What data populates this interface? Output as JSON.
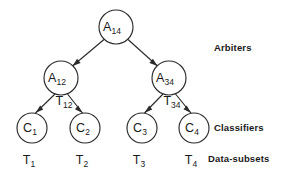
{
  "diagram": {
    "background_color": "#ffffff",
    "stroke_color": "#2b2b2b",
    "text_color": "#1a1a1a"
  },
  "nodes": {
    "root": {
      "base": "A",
      "sub": "14",
      "cx": 116,
      "cy": 27,
      "r": 17
    },
    "arbiter_left": {
      "base": "A",
      "sub": "12",
      "cx": 61,
      "cy": 78,
      "r": 17
    },
    "arbiter_right": {
      "base": "A",
      "sub": "34",
      "cx": 169,
      "cy": 78,
      "r": 17
    },
    "classifier_1": {
      "base": "C",
      "sub": "1",
      "cx": 32,
      "cy": 128,
      "r": 15
    },
    "classifier_2": {
      "base": "C",
      "sub": "2",
      "cx": 85,
      "cy": 128,
      "r": 15
    },
    "classifier_3": {
      "base": "C",
      "sub": "3",
      "cx": 142,
      "cy": 128,
      "r": 15
    },
    "classifier_4": {
      "base": "C",
      "sub": "4",
      "cx": 194,
      "cy": 128,
      "r": 15
    }
  },
  "edge_labels": {
    "left": {
      "base": "T",
      "sub": "12",
      "x": 68,
      "y": 104
    },
    "right": {
      "base": "T",
      "sub": "34",
      "x": 176,
      "y": 104
    }
  },
  "data_subsets": [
    {
      "base": "T",
      "sub": "1",
      "x": 32,
      "y": 163
    },
    {
      "base": "T",
      "sub": "2",
      "x": 85,
      "y": 163
    },
    {
      "base": "T",
      "sub": "3",
      "x": 142,
      "y": 163
    },
    {
      "base": "T",
      "sub": "4",
      "x": 194,
      "y": 163
    }
  ],
  "row_labels": [
    {
      "text": "Arbiters",
      "left": 214,
      "top": 42
    },
    {
      "text": "Classifiers",
      "left": 214,
      "top": 122
    },
    {
      "text": "Data-subsets",
      "left": 208,
      "top": 153
    }
  ]
}
